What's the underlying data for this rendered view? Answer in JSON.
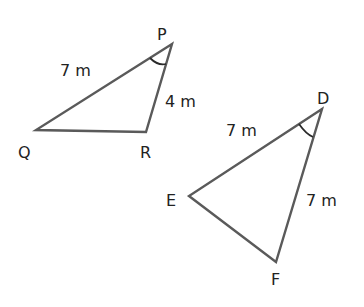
{
  "diagram": {
    "type": "geometry-congruence",
    "triangles": [
      {
        "name": "PQR",
        "vertices": {
          "P": [
            172,
            44
          ],
          "Q": [
            36,
            130
          ],
          "R": [
            146,
            132
          ]
        },
        "vertex_labels": {
          "P": "P",
          "Q": "Q",
          "R": "R"
        },
        "side_labels": {
          "PQ": "7 m",
          "PR": "4 m"
        },
        "marked_angle": "P"
      },
      {
        "name": "DEF",
        "vertices": {
          "D": [
            322,
            109
          ],
          "E": [
            189,
            196
          ],
          "F": [
            276,
            262
          ]
        },
        "vertex_labels": {
          "D": "D",
          "E": "E",
          "F": "F"
        },
        "side_labels": {
          "DE": "7 m",
          "DF": "7 m"
        },
        "marked_angle": "D"
      }
    ],
    "colors": {
      "edge": "#5a5a5a",
      "text": "#222222",
      "arc": "#2a2a2a"
    }
  }
}
